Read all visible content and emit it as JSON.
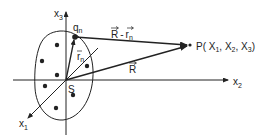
{
  "diagram": {
    "axes": {
      "x1_label": "x",
      "x1_sub": "1",
      "x2_label": "x",
      "x2_sub": "2",
      "x3_label": "x",
      "x3_sub": "3"
    },
    "origin_label": "S",
    "charge": {
      "label": "q",
      "sub": "n"
    },
    "position_vector": {
      "label": "r",
      "sub": "n"
    },
    "field_vector": {
      "label": "R"
    },
    "difference_vector": {
      "label_R": "R",
      "minus": "-",
      "label_r": "r",
      "sub": "n"
    },
    "point": {
      "text": "P( X",
      "s1": "1",
      "c1": ", X",
      "s2": "2",
      "c2": ", X",
      "s3": "3",
      "close": ")"
    },
    "colors": {
      "ink": "#222222",
      "background": "#ffffff"
    }
  }
}
